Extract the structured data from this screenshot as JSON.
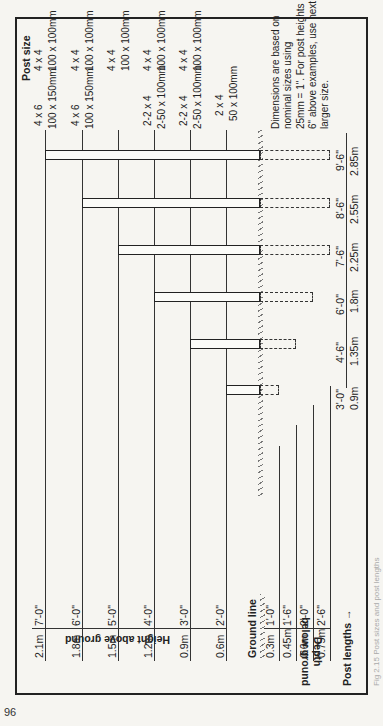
{
  "page_number": "96",
  "caption": "Fig 2.15 Post sizes and post lengths",
  "header": {
    "post_size_title": "Post size"
  },
  "axes": {
    "height_label": "Height above ground",
    "depth_label_1": "Depth",
    "depth_label_2": "below ground",
    "ground_line_label": "Ground line",
    "post_lengths_label": "Post lengths",
    "arrow": "→"
  },
  "heights": [
    {
      "metric": "2.1m",
      "imperial": "7'-0\""
    },
    {
      "metric": "1.8m",
      "imperial": "6'-0\""
    },
    {
      "metric": "1.5m",
      "imperial": "5'-0\""
    },
    {
      "metric": "1.2m",
      "imperial": "4'-0\""
    },
    {
      "metric": "0.9m",
      "imperial": "3'-0\""
    },
    {
      "metric": "0.6m",
      "imperial": "2'-0\""
    }
  ],
  "depths": [
    {
      "metric": "0.3m",
      "imperial": "1'-0\""
    },
    {
      "metric": "0.45m",
      "imperial": "1'-6\""
    },
    {
      "metric": "0.6m",
      "imperial": "2'-0\""
    },
    {
      "metric": "0.75m",
      "imperial": "2'-6\""
    }
  ],
  "post_lengths": [
    {
      "imperial": "3'-0\"",
      "metric": "0.9m"
    },
    {
      "imperial": "4'-6\"",
      "metric": "1.35m"
    },
    {
      "imperial": "6'-0\"",
      "metric": "1.8m"
    },
    {
      "imperial": "7'-6\"",
      "metric": "2.25m"
    },
    {
      "imperial": "8'-6\"",
      "metric": "2.55m"
    },
    {
      "imperial": "9'-6\"",
      "metric": "2.85m"
    }
  ],
  "post_sizes": [
    {
      "row": "7'-0\"",
      "a_imperial": "4 x 6",
      "a_metric": "100 x 150mm",
      "b_imperial": "4 x 4",
      "b_metric": "100 x 100mm"
    },
    {
      "row": "6'-0\"",
      "a_imperial": "4 x 6",
      "a_metric": "100 x 150mm",
      "b_imperial": "4 x 4",
      "b_metric": "100 x 100mm"
    },
    {
      "row": "5'-0\"",
      "a_imperial": "",
      "a_metric": "",
      "b_imperial": "4 x 4",
      "b_metric": "100 x 100mm"
    },
    {
      "row": "4'-0\"",
      "a_imperial": "2-2 x 4",
      "a_metric": "2-50 x 100mm",
      "b_imperial": "4 x 4",
      "b_metric": "100 x 100mm"
    },
    {
      "row": "3'-0\"",
      "a_imperial": "2-2 x 4",
      "a_metric": "2-50 x 100mm",
      "b_imperial": "4 x 4",
      "b_metric": "100 x 100mm"
    },
    {
      "row": "2'-0\"",
      "a_imperial": "2 x 4",
      "a_metric": "50 x 100mm",
      "b_imperial": "",
      "b_metric": ""
    }
  ],
  "note": {
    "line1": "Dimensions are based on",
    "line2": "nominal sizes using",
    "line3": "25mm = 1\". For post heights",
    "line4": "6\" above examples, use next",
    "line5": "larger size."
  },
  "colors": {
    "ink": "#222222",
    "paper": "#f6f5f1"
  }
}
